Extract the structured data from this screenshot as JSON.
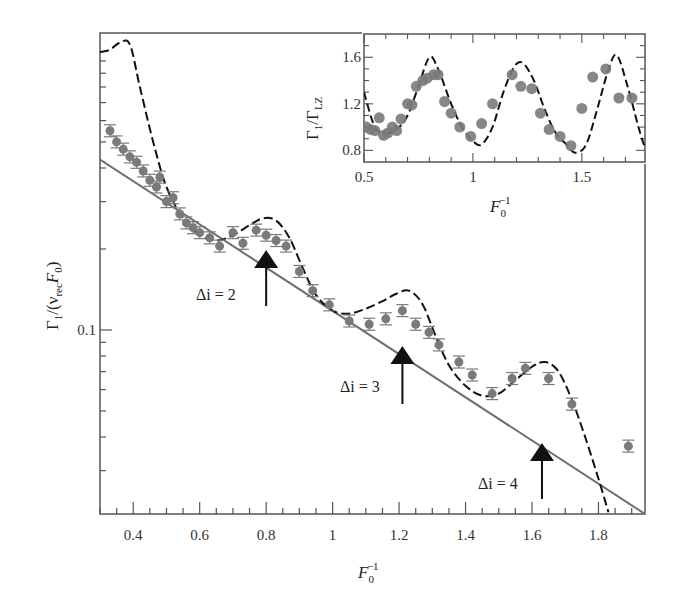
{
  "chart_data": [
    {
      "type": "scatter",
      "title": "",
      "xlabel": "F0^-1",
      "ylabel": "Γ1/(νrec F0)",
      "yscale": "log",
      "xlim": [
        0.3,
        1.94
      ],
      "ylim": [
        0.0207,
        1.27
      ],
      "xticks": [
        0.4,
        0.6,
        0.8,
        1,
        1.2,
        1.4,
        1.6,
        1.8
      ],
      "xtick_labels": [
        "0.4",
        "0.6",
        "0.8",
        "1",
        "1.2",
        "1.4",
        "1.6",
        "1.8"
      ],
      "yticks": [
        0.1
      ],
      "ytick_labels": [
        "0.1"
      ],
      "grid": false,
      "series": [
        {
          "name": "measured",
          "style": "gray markers with error bars",
          "x": [
            0.33,
            0.35,
            0.37,
            0.39,
            0.41,
            0.43,
            0.45,
            0.47,
            0.48,
            0.5,
            0.52,
            0.54,
            0.56,
            0.58,
            0.6,
            0.63,
            0.66,
            0.7,
            0.73,
            0.77,
            0.8,
            0.83,
            0.86,
            0.9,
            0.94,
            0.99,
            1.05,
            1.11,
            1.16,
            1.21,
            1.25,
            1.29,
            1.32,
            1.38,
            1.42,
            1.48,
            1.54,
            1.58,
            1.65,
            1.72,
            1.89
          ],
          "y": [
            0.55,
            0.5,
            0.47,
            0.44,
            0.42,
            0.39,
            0.36,
            0.34,
            0.37,
            0.3,
            0.31,
            0.27,
            0.25,
            0.24,
            0.23,
            0.22,
            0.205,
            0.23,
            0.21,
            0.235,
            0.225,
            0.215,
            0.205,
            0.165,
            0.14,
            0.124,
            0.108,
            0.105,
            0.11,
            0.118,
            0.105,
            0.098,
            0.088,
            0.076,
            0.068,
            0.058,
            0.066,
            0.072,
            0.066,
            0.053,
            0.037
          ]
        },
        {
          "name": "model (dashed)",
          "style": "black dashed line",
          "x": [
            0.3,
            0.33,
            0.36,
            0.39,
            0.42,
            0.46,
            0.5,
            0.55,
            0.6,
            0.65,
            0.7,
            0.75,
            0.79,
            0.83,
            0.87,
            0.91,
            0.95,
            1.0,
            1.05,
            1.1,
            1.15,
            1.19,
            1.23,
            1.27,
            1.31,
            1.35,
            1.4,
            1.45,
            1.5,
            1.55,
            1.6,
            1.64,
            1.68,
            1.72,
            1.76,
            1.8,
            1.83
          ],
          "y": [
            1.08,
            1.1,
            1.17,
            1.15,
            0.8,
            0.5,
            0.34,
            0.26,
            0.225,
            0.215,
            0.225,
            0.245,
            0.26,
            0.255,
            0.22,
            0.17,
            0.135,
            0.118,
            0.115,
            0.12,
            0.128,
            0.136,
            0.14,
            0.125,
            0.095,
            0.074,
            0.062,
            0.057,
            0.058,
            0.065,
            0.073,
            0.076,
            0.07,
            0.055,
            0.04,
            0.028,
            0.021
          ]
        },
        {
          "name": "Landau-Zener fit (solid)",
          "style": "gray solid line",
          "x": [
            0.3,
            1.94
          ],
          "y": [
            0.43,
            0.0207
          ]
        }
      ],
      "annotations": [
        {
          "text": "Δi = 2",
          "arrow_x": 0.8,
          "label_pos": "left of arrow"
        },
        {
          "text": "Δi = 3",
          "arrow_x": 1.21,
          "label_pos": "left of arrow"
        },
        {
          "text": "Δi = 4",
          "arrow_x": 1.63,
          "label_pos": "left of arrow"
        }
      ]
    },
    {
      "type": "scatter",
      "title": "",
      "role": "inset",
      "xlabel": "F0^-1",
      "ylabel": "Γ1/ΓLZ",
      "xlim": [
        0.5,
        1.79
      ],
      "ylim": [
        0.7,
        1.8
      ],
      "xticks": [
        0.5,
        1,
        1.5
      ],
      "xtick_labels": [
        "0.5",
        "1",
        "1.5"
      ],
      "yticks": [
        0.8,
        1.2,
        1.6
      ],
      "ytick_labels": [
        "0.8",
        "1.2",
        "1.6"
      ],
      "grid": false,
      "series": [
        {
          "name": "measured ratio",
          "style": "gray circles",
          "x": [
            0.51,
            0.53,
            0.55,
            0.57,
            0.59,
            0.61,
            0.63,
            0.65,
            0.67,
            0.7,
            0.72,
            0.74,
            0.77,
            0.79,
            0.82,
            0.84,
            0.87,
            0.9,
            0.94,
            0.99,
            1.04,
            1.09,
            1.18,
            1.22,
            1.27,
            1.31,
            1.35,
            1.4,
            1.45,
            1.5,
            1.55,
            1.61,
            1.67,
            1.73
          ],
          "y": [
            1.0,
            0.98,
            0.97,
            1.08,
            0.93,
            0.95,
            1.0,
            0.97,
            1.07,
            1.2,
            1.19,
            1.35,
            1.4,
            1.42,
            1.45,
            1.45,
            1.22,
            1.12,
            1.0,
            0.92,
            1.03,
            1.2,
            1.45,
            1.35,
            1.33,
            1.12,
            0.98,
            0.92,
            0.84,
            1.16,
            1.43,
            1.5,
            1.25,
            1.25
          ]
        },
        {
          "name": "model ratio (dashed)",
          "style": "black dashed line",
          "x": [
            0.5,
            0.55,
            0.6,
            0.65,
            0.7,
            0.75,
            0.8,
            0.84,
            0.9,
            0.95,
            1.0,
            1.04,
            1.09,
            1.14,
            1.19,
            1.23,
            1.28,
            1.33,
            1.38,
            1.43,
            1.47,
            1.52,
            1.57,
            1.62,
            1.66,
            1.71,
            1.76,
            1.79
          ],
          "y": [
            1.3,
            1.0,
            0.95,
            0.98,
            1.1,
            1.35,
            1.6,
            1.5,
            1.2,
            1.0,
            0.88,
            0.85,
            1.0,
            1.3,
            1.52,
            1.55,
            1.4,
            1.15,
            0.95,
            0.85,
            0.78,
            0.85,
            1.15,
            1.48,
            1.62,
            1.35,
            1.0,
            0.82
          ]
        }
      ]
    }
  ],
  "labels": {
    "main_ylabel_gamma": "Γ",
    "main_ylabel_sub1": "1",
    "main_ylabel_mid": "/(ν",
    "main_ylabel_rec": "rec",
    "main_ylabel_F": "F",
    "main_ylabel_sub0": "0",
    "main_ylabel_close": ")",
    "main_xlabel_F": "F",
    "main_xlabel_sub": "0",
    "main_xlabel_sup": "−1",
    "inset_ylabel_gamma": "Γ",
    "inset_ylabel_sub1": "1",
    "inset_ylabel_slash": "/Γ",
    "inset_ylabel_LZ": "LZ",
    "inset_xlabel_F": "F",
    "inset_xlabel_sub": "0",
    "inset_xlabel_sup": "−1",
    "y_tick_0_1": "0.1",
    "annot_di2": "Δi = 2",
    "annot_di3": "Δi = 3",
    "annot_di4": "Δi = 4"
  },
  "colors": {
    "markers": "#7a7a7a",
    "dashed": "#111111",
    "solid": "#6e6e6e",
    "frame": "#555555"
  }
}
